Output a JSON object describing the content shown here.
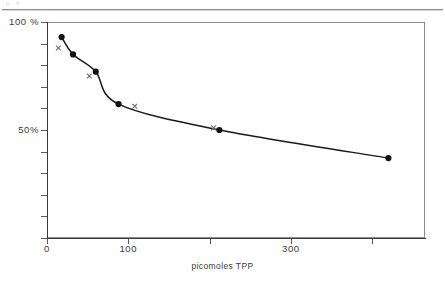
{
  "page": {
    "scan_fragment": "p. 4",
    "rule": "horizontal-rule"
  },
  "chart_data": {
    "type": "line",
    "title": "",
    "subtitle": "",
    "xlabel": "picomoles  TPP",
    "ylabel": "",
    "xlim": [
      0,
      465
    ],
    "ylim": [
      0,
      100
    ],
    "grid": false,
    "legend": "none",
    "x_ticks": [
      {
        "value": 0,
        "label": "0"
      },
      {
        "value": 100,
        "label": "100"
      },
      {
        "value": 200,
        "label": ""
      },
      {
        "value": 300,
        "label": "300"
      },
      {
        "value": 400,
        "label": ""
      }
    ],
    "y_ticks": [
      {
        "value": 100,
        "label": "100 %"
      },
      {
        "value": 90,
        "label": ""
      },
      {
        "value": 80,
        "label": ""
      },
      {
        "value": 70,
        "label": ""
      },
      {
        "value": 60,
        "label": ""
      },
      {
        "value": 50,
        "label": "50%"
      },
      {
        "value": 40,
        "label": ""
      },
      {
        "value": 30,
        "label": ""
      },
      {
        "value": 20,
        "label": ""
      },
      {
        "value": 10,
        "label": ""
      },
      {
        "value": 0,
        "label": ""
      }
    ],
    "series": [
      {
        "name": "fitted curve (filled circles)",
        "marker": "filled-circle",
        "x": [
          18,
          32,
          60,
          88,
          212,
          420
        ],
        "y": [
          93,
          85,
          77,
          62,
          50,
          37
        ]
      },
      {
        "name": "individual assays (crosses)",
        "marker": "cross",
        "x": [
          14,
          52,
          108,
          205
        ],
        "y": [
          88,
          75,
          61,
          51
        ]
      }
    ],
    "curve_color": "#1a1a1a",
    "marker_color": "#111111",
    "cross_color": "#6d6d6d",
    "axis_color": "#3a3a3a",
    "frame_color": "#8d8d8d",
    "background": "#ffffff"
  }
}
